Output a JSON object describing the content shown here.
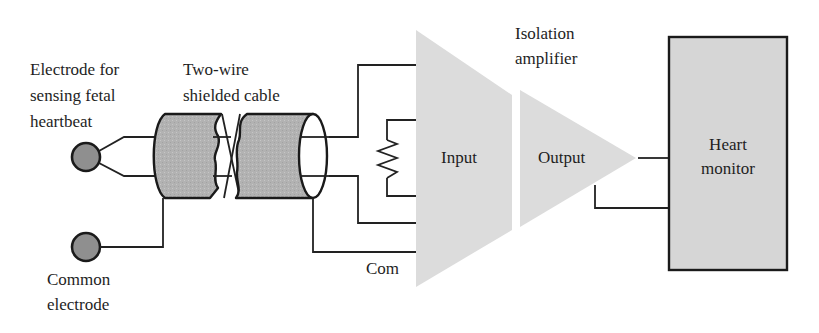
{
  "labels": {
    "electrode_sensing": [
      "Electrode for",
      "sensing fetal",
      "heartbeat"
    ],
    "cable": [
      "Two-wire",
      "shielded cable"
    ],
    "isolation_amplifier": [
      "Isolation",
      "amplifier"
    ],
    "input": "Input",
    "output": "Output",
    "heart_monitor": [
      "Heart",
      "monitor"
    ],
    "com": "Com",
    "common_electrode": [
      "Common",
      "electrode"
    ]
  },
  "colors": {
    "electrode_fill": "#8f8f8f",
    "cable_fill": "#b4b4b4",
    "amplifier_fill": "#dcdcdc",
    "monitor_fill": "#d6d6d6",
    "line": "#1e1e1e"
  }
}
